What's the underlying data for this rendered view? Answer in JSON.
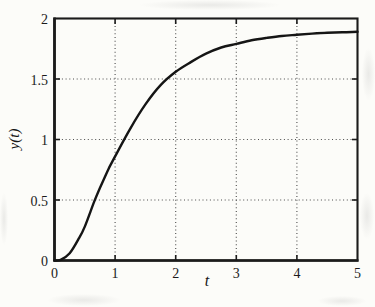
{
  "figure": {
    "paper_color": "#fcfcf9",
    "ink_color": "#1b1b1b",
    "grid_color": "#3a3a3a"
  },
  "chart_data": {
    "type": "line",
    "title": "",
    "xlabel": "t",
    "ylabel": "y(t)",
    "xlim": [
      0,
      5
    ],
    "ylim": [
      0,
      2
    ],
    "x_ticks": [
      0,
      1,
      2,
      3,
      4,
      5
    ],
    "y_ticks": [
      0,
      0.5,
      1,
      1.5,
      2
    ],
    "x_tick_labels": [
      "0",
      "1",
      "2",
      "3",
      "4",
      "5"
    ],
    "y_tick_labels": [
      "0",
      "0.5",
      "1",
      "1.5",
      "2"
    ],
    "grid": "dotted",
    "legend": "none",
    "series": [
      {
        "name": "y(t)",
        "color": "#151515",
        "x": [
          0,
          0.1,
          0.25,
          0.4,
          0.5,
          0.65,
          0.75,
          0.9,
          1.0,
          1.25,
          1.5,
          1.75,
          2.0,
          2.25,
          2.5,
          2.75,
          3.0,
          3.25,
          3.5,
          3.75,
          4.0,
          4.25,
          4.5,
          4.75,
          5.0
        ],
        "y": [
          0,
          0.005,
          0.06,
          0.18,
          0.28,
          0.48,
          0.6,
          0.765,
          0.86,
          1.09,
          1.29,
          1.45,
          1.56,
          1.64,
          1.71,
          1.76,
          1.79,
          1.82,
          1.84,
          1.855,
          1.865,
          1.875,
          1.882,
          1.887,
          1.89
        ]
      }
    ]
  }
}
